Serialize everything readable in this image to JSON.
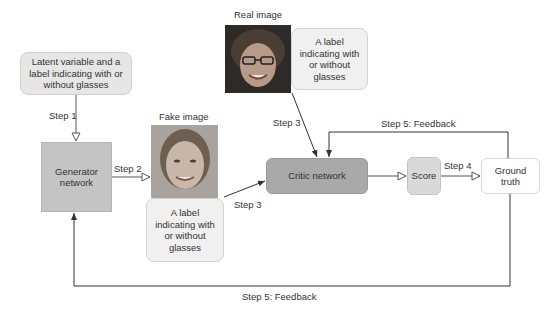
{
  "diagram": {
    "nodes": {
      "latent": "Latent variable and a label indicating with or without glasses",
      "generator": "Generator network",
      "fake_image_caption": "Fake image",
      "fake_label": "A label indicating with or without glasses",
      "real_image_caption": "Real image",
      "real_label": "A label indicating with or without glasses",
      "critic": "Critic network",
      "score": "Score",
      "ground_truth": "Ground truth"
    },
    "edges": {
      "step1": "Step 1",
      "step2": "Step 2",
      "step3_fake": "Step 3",
      "step3_real": "Step 3",
      "step4": "Step 4",
      "step5_top": "Step 5: Feedback",
      "step5_bottom": "Step 5: Feedback"
    },
    "colors": {
      "generator": "#c4c4c4",
      "critic": "#a9a9a9",
      "score": "#d9d9d9",
      "label_box": "#f0f0f0",
      "latent": "#e6e6e6"
    }
  }
}
